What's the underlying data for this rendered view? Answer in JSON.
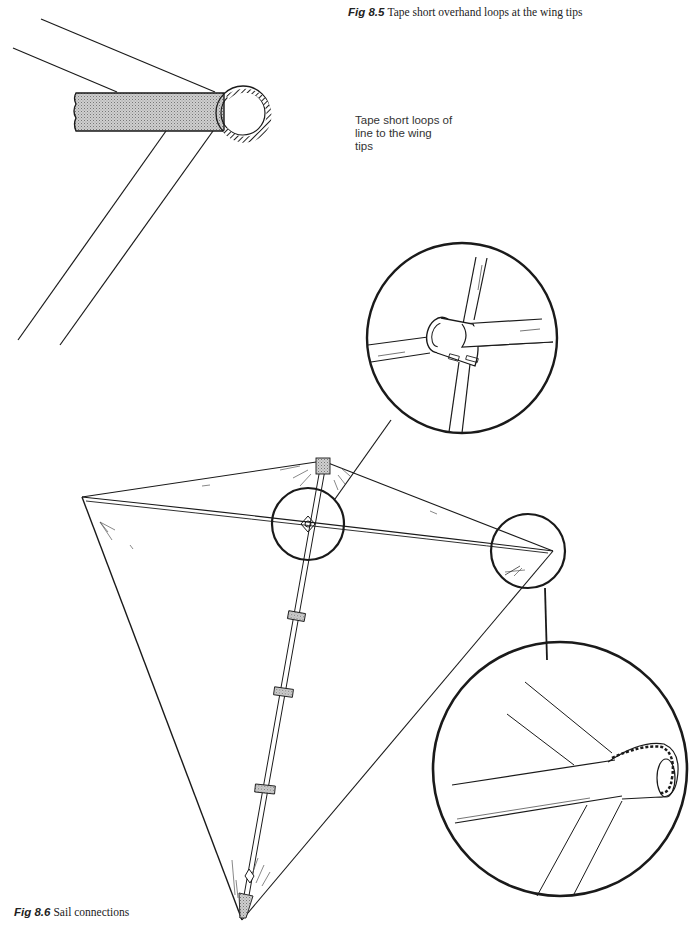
{
  "figures": [
    {
      "id_label": "Fig 8.5",
      "caption": "Tape short overhand loops at the wing tips",
      "annotation": [
        "Tape short loops of",
        "line to the wing",
        "tips"
      ]
    },
    {
      "id_label": "Fig 8.6",
      "caption": "Sail connections"
    }
  ],
  "colors": {
    "line": "#1a1a1a",
    "tape_fill": "#bdbdbd",
    "background": "#ffffff"
  }
}
